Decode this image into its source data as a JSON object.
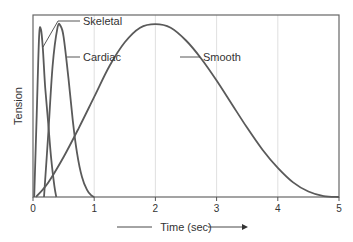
{
  "chart_data": {
    "type": "line",
    "title": "",
    "xlabel": "Time (sec)",
    "ylabel": "Tension",
    "xlim": [
      0,
      5
    ],
    "ylim": [
      0,
      1
    ],
    "xticks": [
      0,
      1,
      2,
      3,
      4,
      5
    ],
    "xtick_labels": [
      "0",
      "1",
      "2",
      "3",
      "4",
      "5"
    ],
    "yticks": [],
    "grid": {
      "vertical": true,
      "horizontal": false
    },
    "legend": "inline labels with leader lines",
    "colors": {
      "curve": "#5a5a5a",
      "grid": "#d8d8d8",
      "frame": "#555555",
      "text": "#333333"
    },
    "series": [
      {
        "name": "Skeletal",
        "x": [
          0.02,
          0.06,
          0.1,
          0.13,
          0.16,
          0.2,
          0.25,
          0.3,
          0.35,
          0.38
        ],
        "y": [
          0.0,
          0.45,
          0.88,
          0.92,
          0.82,
          0.6,
          0.4,
          0.2,
          0.06,
          0.0
        ]
      },
      {
        "name": "Cardiac",
        "x": [
          0.18,
          0.25,
          0.32,
          0.4,
          0.45,
          0.5,
          0.58,
          0.65,
          0.72,
          0.8,
          0.88,
          0.95,
          1.0
        ],
        "y": [
          0.0,
          0.35,
          0.72,
          0.93,
          0.94,
          0.88,
          0.65,
          0.42,
          0.24,
          0.11,
          0.04,
          0.01,
          0.0
        ]
      },
      {
        "name": "Smooth",
        "x": [
          0.05,
          0.25,
          0.5,
          0.75,
          1.0,
          1.25,
          1.5,
          1.75,
          2.0,
          2.25,
          2.5,
          2.75,
          3.0,
          3.25,
          3.5,
          3.75,
          4.0,
          4.25,
          4.5,
          4.75,
          5.0
        ],
        "y": [
          0.0,
          0.08,
          0.22,
          0.38,
          0.55,
          0.72,
          0.85,
          0.93,
          0.95,
          0.93,
          0.86,
          0.76,
          0.64,
          0.51,
          0.38,
          0.26,
          0.16,
          0.08,
          0.03,
          0.005,
          0.0
        ]
      }
    ],
    "annotations": [
      {
        "text": "Skeletal",
        "points_to": "Skeletal peak"
      },
      {
        "text": "Cardiac",
        "points_to": "Cardiac peak"
      },
      {
        "text": "Smooth",
        "points_to": "Smooth descending limb"
      }
    ],
    "xlabel_arrow": "right"
  }
}
